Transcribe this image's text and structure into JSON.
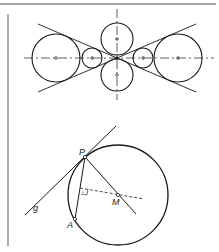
{
  "figure": {
    "top": {
      "caption": "",
      "axis_horizontal": {
        "y": 58,
        "x1": 24,
        "x2": 214
      },
      "axis_vertical": {
        "x": 117,
        "y1": 10,
        "y2": 100
      },
      "circles": [
        {
          "name": "large-left",
          "cx": 56,
          "cy": 58,
          "r": 24
        },
        {
          "name": "small-left",
          "cx": 92,
          "cy": 58,
          "r": 10
        },
        {
          "name": "top",
          "cx": 117,
          "cy": 39,
          "r": 16
        },
        {
          "name": "bottom",
          "cx": 117,
          "cy": 75,
          "r": 16
        },
        {
          "name": "small-right",
          "cx": 143,
          "cy": 58,
          "r": 10
        },
        {
          "name": "large-right",
          "cx": 178,
          "cy": 58,
          "r": 24
        }
      ]
    },
    "bottom": {
      "labels": {
        "P": "P",
        "M": "M",
        "A": "A",
        "g": "g"
      },
      "circle": {
        "cx": 118,
        "cy": 195,
        "r": 50
      },
      "points": {
        "P": [
          85,
          157
        ],
        "M": [
          118,
          195
        ],
        "A": [
          75,
          219
        ]
      }
    },
    "colors": {
      "stroke": "#1a1a1a",
      "background": "#ffffff",
      "frame": "#555555"
    }
  }
}
